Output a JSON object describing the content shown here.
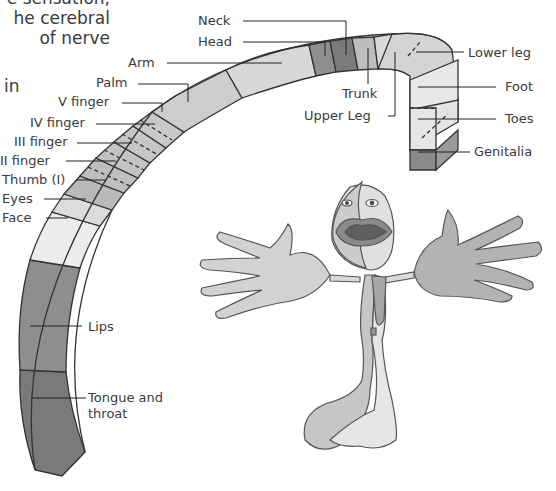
{
  "intro_text": {
    "lines": [
      "e sensation,",
      "he  cerebral",
      "of  nerve"
    ],
    "fragment": "in"
  },
  "homunculus_band": {
    "labels": {
      "neck": "Neck",
      "head": "Head",
      "arm": "Arm",
      "palm": "Palm",
      "v_finger": "V finger",
      "iv_finger": "IV finger",
      "iii_finger": "III finger",
      "ii_finger": "II finger",
      "thumb": "Thumb (I)",
      "eyes": "Eyes",
      "face": "Face",
      "lips": "Lips",
      "tongue_line1": "Tongue and",
      "tongue_line2": "throat",
      "trunk": "Trunk",
      "upper_leg": "Upper Leg",
      "lower_leg": "Lower leg",
      "foot": "Foot",
      "toes": "Toes",
      "genitalia": "Genitalia"
    }
  },
  "colors": {
    "light": "#e6e6e6",
    "mid": "#c4c4c4",
    "dark": "#8a8a8a",
    "darker": "#6f6f6f",
    "outline": "#333333"
  }
}
